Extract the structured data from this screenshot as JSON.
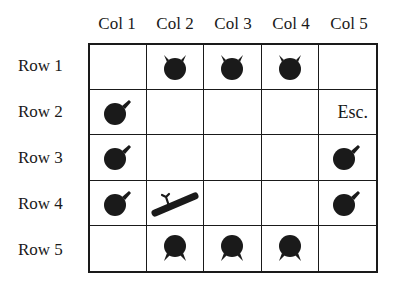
{
  "columns": [
    "Col 1",
    "Col 2",
    "Col 3",
    "Col 4",
    "Col 5"
  ],
  "rows": [
    "Row 1",
    "Row 2",
    "Row 3",
    "Row 4",
    "Row 5"
  ],
  "cells": [
    [
      "",
      "piece-down",
      "piece-down",
      "piece-down",
      ""
    ],
    [
      "piece-right",
      "",
      "",
      "",
      "Esc."
    ],
    [
      "piece-right",
      "",
      "",
      "",
      "piece-right"
    ],
    [
      "piece-right",
      "player-ship",
      "",
      "",
      "piece-right"
    ],
    [
      "",
      "piece-up",
      "piece-up",
      "piece-up",
      ""
    ]
  ],
  "escape_label": "Esc.",
  "colors": {
    "ink": "#1a1a1a",
    "background": "#ffffff"
  }
}
